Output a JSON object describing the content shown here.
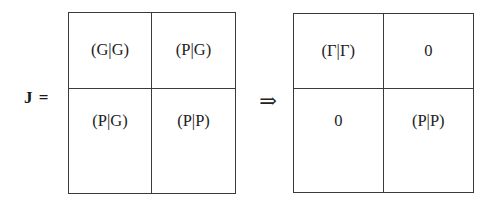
{
  "figure": {
    "equation_label": "J =",
    "implication_symbol": "⇒"
  },
  "matrix_before": {
    "name": "J",
    "rows": 2,
    "cols": 2,
    "cells": [
      [
        "(G|G)",
        "(P|G)"
      ],
      [
        "(P|G)",
        "(P|P)"
      ]
    ]
  },
  "matrix_after": {
    "name": "block-diagonal J",
    "rows": 2,
    "cols": 2,
    "cells": [
      [
        "(Γ|Γ)",
        "0"
      ],
      [
        "0",
        "(P|P)"
      ]
    ]
  },
  "colors": {
    "background": "#ffffff",
    "border": "#3a3a3a",
    "text": "#222222",
    "label": "#191919"
  }
}
